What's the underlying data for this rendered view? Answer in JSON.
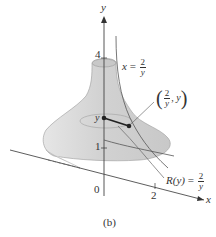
{
  "figure": {
    "caption": "(b)",
    "axes": {
      "y_label": "y",
      "x_label": "x",
      "origin_label": "0",
      "y_tick_1": "1",
      "y_tick_4": "4",
      "x_tick_2": "2"
    },
    "labels": {
      "curve_eq": {
        "lhs": "x",
        "eq": "=",
        "num": "2",
        "den": "y"
      },
      "point": {
        "num": "2",
        "den": "y",
        "comma_y": ", y"
      },
      "radius": {
        "lhs": "R(y)",
        "eq": "=",
        "num": "2",
        "den": "y"
      },
      "y_marker": "y"
    },
    "colors": {
      "surface_fill": "#d9d9d9",
      "surface_shade": "#c4c4c4",
      "axis": "#333333",
      "radius_segment": "#222222",
      "point": "#222222"
    }
  }
}
